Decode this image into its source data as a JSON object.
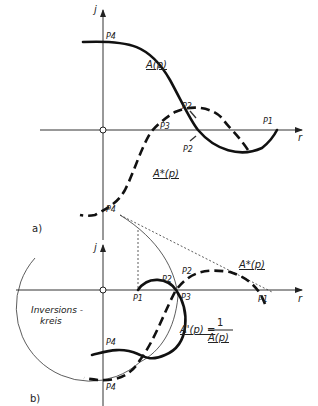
{
  "figure_a": {
    "panel_label": "a)",
    "axis_y_label": "j",
    "axis_x_label": "r",
    "curve_A": "A(p)",
    "curve_A_star": "A*(p)",
    "points": {
      "P1": "P1",
      "P2_upper": "P2",
      "P2_lower": "P2",
      "P3": "P3",
      "P4_top": "P4",
      "P4_bottom": "P4"
    }
  },
  "figure_b": {
    "panel_label": "b)",
    "axis_y_label": "j",
    "axis_x_label": "r",
    "curve_A_star": "A*(p)",
    "curve_A_prime": "A'(p) =",
    "fraction_numerator": "1",
    "fraction_denominator": "A(p)",
    "inversion_circle_label_1": "Inversions -",
    "inversion_circle_label_2": "kreis",
    "points": {
      "P1_left": "P1",
      "P1_right": "P1",
      "P2_left": "P2",
      "P2_right": "P2",
      "P3": "P3",
      "P4_top": "P4",
      "P4_bottom": "P4"
    }
  }
}
